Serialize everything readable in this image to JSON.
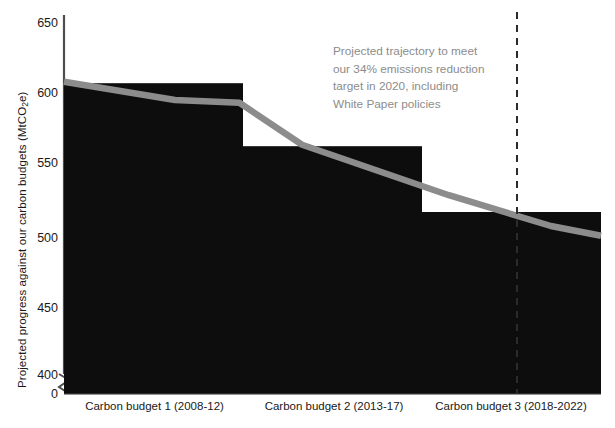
{
  "chart_data": {
    "type": "bar",
    "title": "",
    "xlabel": "",
    "ylabel": "Projected progress against our carbon budgets (MtCO₂e)",
    "ylabel_main": "Projected progress against our carbon budgets (MtCO",
    "ylabel_sub": "2",
    "ylabel_tail": "e)",
    "categories": [
      "Carbon budget 1 (2008-12)",
      "Carbon budget 2 (2013-17)",
      "Carbon budget 3 (2018-2022)"
    ],
    "values": [
      607,
      562,
      515
    ],
    "series": [
      {
        "name": "Carbon budget (annual average)",
        "type": "bar",
        "values": [
          607,
          562,
          515
        ]
      },
      {
        "name": "Projected trajectory to meet our 34% emissions reduction target in 2020, including White Paper policies",
        "type": "line",
        "points": [
          {
            "x": 0.0,
            "y": 608
          },
          {
            "x": 0.62,
            "y": 595
          },
          {
            "x": 0.98,
            "y": 593
          },
          {
            "x": 1.33,
            "y": 563
          },
          {
            "x": 2.15,
            "y": 527
          },
          {
            "x": 2.72,
            "y": 505
          },
          {
            "x": 3.0,
            "y": 498
          }
        ]
      }
    ],
    "ylim": [
      400,
      650
    ],
    "y_ticks": [
      "650",
      "600",
      "550",
      "500",
      "450",
      "400",
      "0"
    ],
    "y_axis_break": true,
    "grid": false,
    "legend": "none",
    "annotations": [
      {
        "name": "trajectory-note",
        "lines": [
          "Projected trajectory to meet",
          "our 34% emissions reduction",
          "target in 2020, including",
          "White Paper policies"
        ]
      },
      {
        "name": "target-year-marker",
        "style": "dashed-vertical",
        "label": "2020"
      }
    ],
    "colors": {
      "bar": "#0d0d0d",
      "line": "#8c8c8c",
      "annotation_text": "#8c8c8c",
      "axis": "#4d4d4d",
      "tick_text": "#1a1a1a",
      "background": "#ffffff",
      "dashed_marker": "#2b2b2b"
    }
  },
  "page": {
    "top_clipped_text": ""
  }
}
